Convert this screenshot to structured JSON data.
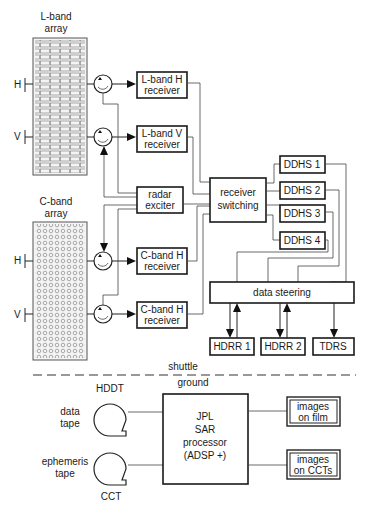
{
  "diagram": {
    "shuttle": {
      "l_band_array": {
        "line1": "L-band",
        "line2": "array",
        "h_label": "H",
        "v_label": "V"
      },
      "c_band_array": {
        "line1": "C-band",
        "line2": "array",
        "h_label": "H",
        "v_label": "V"
      },
      "receivers": [
        {
          "line1": "L-band H",
          "line2": "receiver"
        },
        {
          "line1": "L-band V",
          "line2": "receiver"
        },
        {
          "line1": "C-band H",
          "line2": "receiver"
        },
        {
          "line1": "C-band H",
          "line2": "receiver"
        }
      ],
      "radar_exciter": {
        "line1": "radar",
        "line2": "exciter"
      },
      "receiver_switching": {
        "line1": "receiver",
        "line2": "switching"
      },
      "ddhs": [
        "DDHS 1",
        "DDHS 2",
        "DDHS 3",
        "DDHS 4"
      ],
      "data_steering": "data steering",
      "recorders": [
        "HDRR 1",
        "HDRR 2",
        "TDRS"
      ]
    },
    "divider": {
      "top_label": "shuttle",
      "bottom_label": "ground"
    },
    "ground": {
      "hddt": "HDDT",
      "data_tape": {
        "line1": "data",
        "line2": "tape"
      },
      "ephemeris_tape": {
        "line1": "ephemeris",
        "line2": "tape"
      },
      "cct": "CCT",
      "processor": {
        "line1": "JPL",
        "line2": "SAR",
        "line3": "processor",
        "line4": "(ADSP +)"
      },
      "outputs": [
        {
          "line1": "images",
          "line2": "on film"
        },
        {
          "line1": "images",
          "line2": "on CCTs"
        }
      ]
    }
  }
}
